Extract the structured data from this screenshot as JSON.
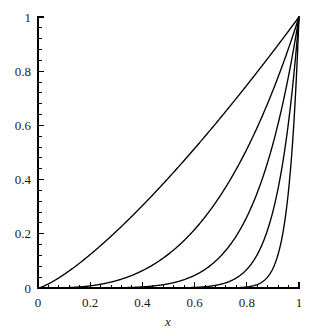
{
  "chart_data": {
    "type": "line",
    "title": "",
    "subtitle": "",
    "xlabel": "x",
    "ylabel": "",
    "xlim": [
      0,
      1
    ],
    "ylim": [
      0,
      1
    ],
    "grid": false,
    "legend": "none",
    "x_ticks": [
      "0",
      "0.2",
      "0.4",
      "0.6",
      "0.8",
      "1"
    ],
    "x_tick_values": [
      0,
      0.2,
      0.4,
      0.6,
      0.8,
      1
    ],
    "y_ticks": [
      "0",
      "0.2",
      "0.4",
      "0.6",
      "0.8",
      "1"
    ],
    "y_tick_values": [
      0,
      0.2,
      0.4,
      0.6,
      0.8,
      1
    ],
    "minor_ticks_per_interval": 4,
    "line_color": "#000000",
    "background_color": "#ffffff",
    "x": [
      0,
      0.05,
      0.1,
      0.15,
      0.2,
      0.25,
      0.3,
      0.35,
      0.4,
      0.45,
      0.5,
      0.55,
      0.6,
      0.65,
      0.7,
      0.75,
      0.8,
      0.85,
      0.9,
      0.95,
      1
    ],
    "series": [
      {
        "name": "curve-1",
        "exponent": 1.3,
        "values": [
          0,
          0.0257,
          0.0631,
          0.1047,
          0.1552,
          0.2042,
          0.2578,
          0.3145,
          0.3742,
          0.4367,
          0.5019,
          0.5696,
          0.6397,
          0.7121,
          0.7868,
          0.8637,
          0.9428,
          1,
          1,
          1,
          1
        ]
      },
      {
        "name": "curve-2",
        "exponent": 3,
        "values": [
          0,
          0.000125,
          0.001,
          0.003375,
          0.008,
          0.0156,
          0.027,
          0.0429,
          0.064,
          0.0911,
          0.125,
          0.1664,
          0.216,
          0.2746,
          0.343,
          0.4219,
          0.512,
          0.6141,
          0.729,
          0.8574,
          1
        ]
      },
      {
        "name": "curve-3",
        "exponent": 6,
        "values": [
          0,
          1.56e-08,
          1e-06,
          1.14e-05,
          6.4e-05,
          0.000244,
          0.000729,
          0.001838,
          0.004096,
          0.008303,
          0.015625,
          0.02768,
          0.046656,
          0.07541,
          0.117649,
          0.17798,
          0.262144,
          0.37715,
          0.531441,
          0.735092,
          1
        ]
      },
      {
        "name": "curve-4",
        "exponent": 12,
        "values": [
          0,
          0,
          0,
          0,
          4.1e-09,
          6e-08,
          5.3e-07,
          3.4e-06,
          1.68e-05,
          6.89e-05,
          0.000244,
          0.000766,
          0.002177,
          0.005688,
          0.013841,
          0.031676,
          0.068719,
          0.142242,
          0.282429,
          0.54036,
          1
        ]
      },
      {
        "name": "curve-5",
        "exponent": 25,
        "values": [
          0,
          0,
          0,
          0,
          0,
          0,
          0,
          0,
          0,
          0,
          2.98e-08,
          5e-07,
          2.8e-06,
          2.27e-05,
          0.000134,
          0.000753,
          0.003778,
          0.017368,
          0.07179,
          0.277389,
          1
        ]
      }
    ]
  },
  "axis": {
    "x_label": "x"
  }
}
